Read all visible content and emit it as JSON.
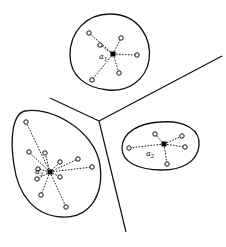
{
  "diagram": {
    "type": "voronoi-clustering",
    "colors": {
      "line": "#111111",
      "background": "#ffffff",
      "center": "#000000"
    },
    "separators": [
      {
        "from": [
          50,
          98
        ],
        "to": [
          99,
          121
        ]
      },
      {
        "from": [
          99,
          121
        ],
        "to": [
          222,
          56
        ]
      },
      {
        "from": [
          99,
          121
        ],
        "to": [
          126,
          232
        ]
      }
    ],
    "clusters": [
      {
        "id": "top",
        "label": {
          "base": "a",
          "sub": "1",
          "x": 99,
          "y": 59
        },
        "center": [
          113,
          54
        ],
        "outline": "M 110 14 C 140 14 152 40 149 60 C 146 80 128 92 108 90 C 86 88 70 76 70 55 C 70 32 86 14 110 14 Z",
        "points": [
          [
            89,
            33
          ],
          [
            100,
            45
          ],
          [
            121,
            38
          ],
          [
            137,
            55
          ],
          [
            119,
            73
          ],
          [
            92,
            80
          ]
        ]
      },
      {
        "id": "right",
        "label": {
          "base": "a",
          "sub": "2",
          "x": 146,
          "y": 156
        },
        "center": [
          164,
          144
        ],
        "outline": "M 160 122 C 185 120 201 130 199 146 C 197 162 182 170 162 170 C 138 170 122 162 122 148 C 122 132 140 123 160 122 Z",
        "points": [
          [
            129,
            148
          ],
          [
            155,
            134
          ],
          [
            182,
            136
          ],
          [
            185,
            147
          ],
          [
            167,
            164
          ]
        ]
      },
      {
        "id": "left",
        "label": {
          "base": "a",
          "sub": "3",
          "x": 35,
          "y": 174
        },
        "center": [
          50,
          172
        ],
        "outline": "M 25 111 C 50 106 95 130 100 165 C 104 195 90 218 62 217 C 35 216 18 195 14 165 C 10 140 12 114 25 111 Z",
        "points": [
          [
            26,
            122
          ],
          [
            29,
            152
          ],
          [
            45,
            153
          ],
          [
            60,
            162
          ],
          [
            78,
            159
          ],
          [
            92,
            167
          ],
          [
            38,
            169
          ],
          [
            60,
            177
          ],
          [
            37,
            179
          ],
          [
            41,
            195
          ],
          [
            66,
            207
          ]
        ]
      }
    ]
  }
}
